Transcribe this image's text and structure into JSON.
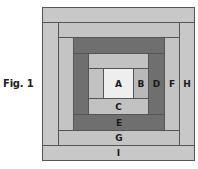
{
  "figure": {
    "label": "Fig. 1",
    "type": "log cabin quilt block diagram"
  },
  "colors": {
    "center": "#eeeeee",
    "light": "#c6c6c6",
    "medium_light": "#b9b9b9",
    "dark": "#6f6f6f",
    "outline": "#555555"
  },
  "pieces": [
    {
      "id": "A",
      "label": "A"
    },
    {
      "id": "B",
      "label": "B"
    },
    {
      "id": "C",
      "label": "C"
    },
    {
      "id": "D",
      "label": "D"
    },
    {
      "id": "E",
      "label": "E"
    },
    {
      "id": "F",
      "label": "F"
    },
    {
      "id": "G",
      "label": "G"
    },
    {
      "id": "H",
      "label": "H"
    },
    {
      "id": "I",
      "label": "I"
    }
  ]
}
